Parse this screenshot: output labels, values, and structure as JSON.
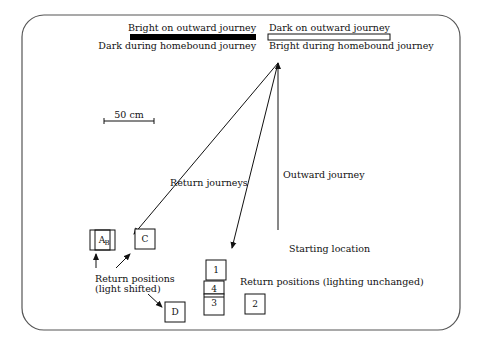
{
  "legend": {
    "bright_bar": {
      "top_label": "Bright on outward journey",
      "bottom_label": "Dark during homebound journey"
    },
    "dark_bar": {
      "top_label": "Dark on outward journey",
      "bottom_label": "Bright during homebound journey"
    }
  },
  "scale_bar": {
    "label": "50 cm"
  },
  "labels": {
    "return_journeys": "Return journeys",
    "outward_journey": "Outward journey",
    "starting_location": "Starting location",
    "return_shifted_line1": "Return positions",
    "return_shifted_line2": "(light shifted)",
    "return_unchanged": "Return positions (lighting unchanged)"
  },
  "boxes": {
    "A": "A",
    "B": "B",
    "C": "C",
    "D": "D",
    "n1": "1",
    "n2": "2",
    "n3": "3",
    "n4": "4"
  },
  "colors": {
    "stroke": "#111111",
    "frame": "#555555",
    "background": "#ffffff"
  }
}
